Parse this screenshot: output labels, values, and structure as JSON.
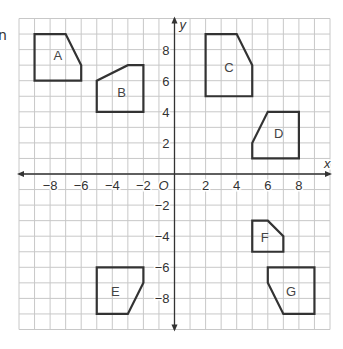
{
  "fragment_text": "n",
  "grid": {
    "origin_px": [
      174.5,
      174
    ],
    "unit_px": 15.55,
    "x_range": [
      -10,
      10
    ],
    "y_range": [
      -10,
      10
    ],
    "grid_color": "#c8c8c8",
    "axis_color": "#333333",
    "shape_color": "#333333"
  },
  "axes": {
    "x_label": "x",
    "y_label": "y",
    "origin_label": "O",
    "x_ticks": [
      {
        "value": -8,
        "label": "−8"
      },
      {
        "value": -6,
        "label": "−6"
      },
      {
        "value": -4,
        "label": "−4"
      },
      {
        "value": -2,
        "label": "−2"
      },
      {
        "value": 2,
        "label": "2"
      },
      {
        "value": 4,
        "label": "4"
      },
      {
        "value": 6,
        "label": "6"
      },
      {
        "value": 8,
        "label": "8"
      }
    ],
    "y_ticks": [
      {
        "value": 8,
        "label": "8"
      },
      {
        "value": 6,
        "label": "6"
      },
      {
        "value": 4,
        "label": "4"
      },
      {
        "value": 2,
        "label": "2"
      },
      {
        "value": -2,
        "label": "−2"
      },
      {
        "value": -4,
        "label": "−4"
      },
      {
        "value": -6,
        "label": "−6"
      },
      {
        "value": -8,
        "label": "−8"
      }
    ]
  },
  "shapes": [
    {
      "label": "A",
      "points": [
        [
          -9,
          6
        ],
        [
          -9,
          9
        ],
        [
          -7,
          9
        ],
        [
          -6,
          7
        ],
        [
          -6,
          6
        ]
      ],
      "label_pos": [
        -7.5,
        7.6
      ]
    },
    {
      "label": "B",
      "points": [
        [
          -5,
          4
        ],
        [
          -5,
          6
        ],
        [
          -3,
          7
        ],
        [
          -2,
          7
        ],
        [
          -2,
          4
        ]
      ],
      "label_pos": [
        -3.4,
        5.2
      ]
    },
    {
      "label": "C",
      "points": [
        [
          2,
          5
        ],
        [
          2,
          9
        ],
        [
          4,
          9
        ],
        [
          5,
          7
        ],
        [
          5,
          5
        ]
      ],
      "label_pos": [
        3.5,
        6.8
      ]
    },
    {
      "label": "D",
      "points": [
        [
          5,
          1
        ],
        [
          5,
          2
        ],
        [
          6,
          4
        ],
        [
          8,
          4
        ],
        [
          8,
          1
        ]
      ],
      "label_pos": [
        6.7,
        2.6
      ]
    },
    {
      "label": "E",
      "points": [
        [
          -5,
          -6
        ],
        [
          -2,
          -6
        ],
        [
          -2,
          -7
        ],
        [
          -3,
          -9
        ],
        [
          -5,
          -9
        ]
      ],
      "label_pos": [
        -3.8,
        -7.6
      ]
    },
    {
      "label": "F",
      "points": [
        [
          5,
          -3
        ],
        [
          6,
          -3
        ],
        [
          7,
          -4
        ],
        [
          7,
          -5
        ],
        [
          5,
          -5
        ]
      ],
      "label_pos": [
        5.8,
        -4.1
      ]
    },
    {
      "label": "G",
      "points": [
        [
          6,
          -6
        ],
        [
          9,
          -6
        ],
        [
          9,
          -9
        ],
        [
          7,
          -9
        ],
        [
          6,
          -7
        ]
      ],
      "label_pos": [
        7.5,
        -7.6
      ]
    }
  ]
}
